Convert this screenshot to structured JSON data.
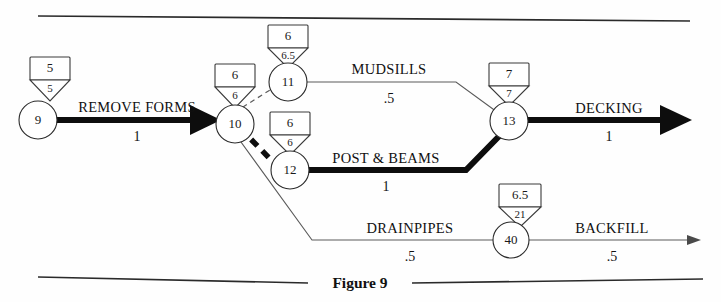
{
  "figure": {
    "caption": "Figure 9",
    "type": "cpm-activity-on-arrow-network"
  },
  "nodes": [
    {
      "id": "9",
      "box_value": "5",
      "triangle_value": "5"
    },
    {
      "id": "10",
      "box_value": "6",
      "triangle_value": "6"
    },
    {
      "id": "11",
      "box_value": "6",
      "triangle_value": "6.5"
    },
    {
      "id": "12",
      "box_value": "6",
      "triangle_value": "6"
    },
    {
      "id": "13",
      "box_value": "7",
      "triangle_value": "7"
    },
    {
      "id": "40",
      "box_value": "6.5",
      "triangle_value": "21"
    }
  ],
  "activities": [
    {
      "name": "REMOVE FORMS",
      "duration": "1",
      "from": "9",
      "to": "10",
      "critical": true
    },
    {
      "name": "MUDSILLS",
      "duration": ".5",
      "from": "11",
      "to": "13",
      "critical": false
    },
    {
      "name": "POST & BEAMS",
      "duration": "1",
      "from": "12",
      "to": "13",
      "critical": true
    },
    {
      "name": "DECKING",
      "duration": "1",
      "from": "13",
      "to": "",
      "critical": true
    },
    {
      "name": "DRAINPIPES",
      "duration": ".5",
      "from": "10",
      "to": "40",
      "critical": false
    },
    {
      "name": "BACKFILL",
      "duration": ".5",
      "from": "40",
      "to": "",
      "critical": false
    }
  ],
  "dummy_links": [
    {
      "from": "10",
      "to": "11",
      "style": "dashed-thin"
    },
    {
      "from": "10",
      "to": "12",
      "style": "dashed-thick"
    }
  ],
  "colors": {
    "critical_path": "#0d0d0d",
    "normal_path": "#5a5a5a",
    "node_stroke": "#2b2b2b",
    "background": "#fefefe",
    "text": "#111111"
  }
}
